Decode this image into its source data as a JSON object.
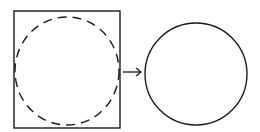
{
  "diagram": {
    "left_figure": {
      "shape": "square-with-dashed-inscribed-circle"
    },
    "connector": {
      "shape": "arrow",
      "direction": "right"
    },
    "right_figure": {
      "shape": "solid-circle"
    },
    "stroke_color": "#1a1a1a",
    "background": "#ffffff"
  }
}
